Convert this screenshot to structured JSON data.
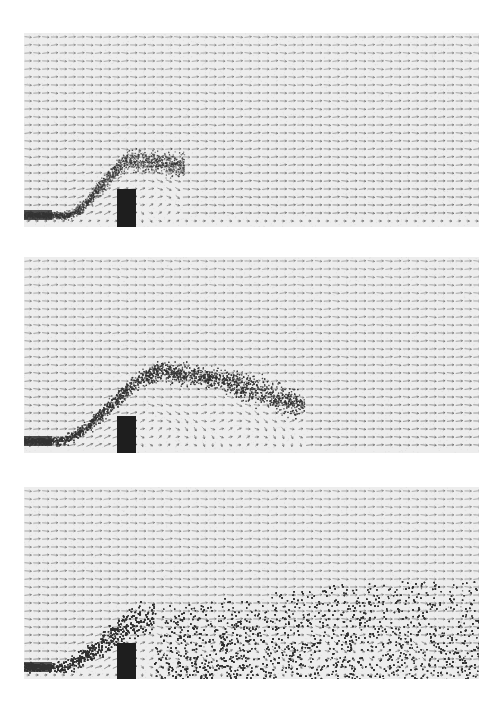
{
  "figure": {
    "colors": {
      "background": "#ffffff",
      "field_background": "#ededed",
      "vector": "#555555",
      "particle": "#333333",
      "obstacle": "#1e1e1e"
    },
    "panels": [
      {
        "id": "snapshot-1",
        "stage": "early",
        "jet_extent_fraction": 0.38,
        "particle_density": "plume rising over obstacle, small vortex behind obstacle"
      },
      {
        "id": "snapshot-2",
        "stage": "intermediate",
        "jet_extent_fraction": 0.6,
        "particle_density": "plume arching over obstacle with recirculation eddy downstream"
      },
      {
        "id": "snapshot-3",
        "stage": "late",
        "jet_extent_fraction": 1.0,
        "particle_density": "particles fill lower half of domain downstream of obstacle"
      }
    ]
  }
}
